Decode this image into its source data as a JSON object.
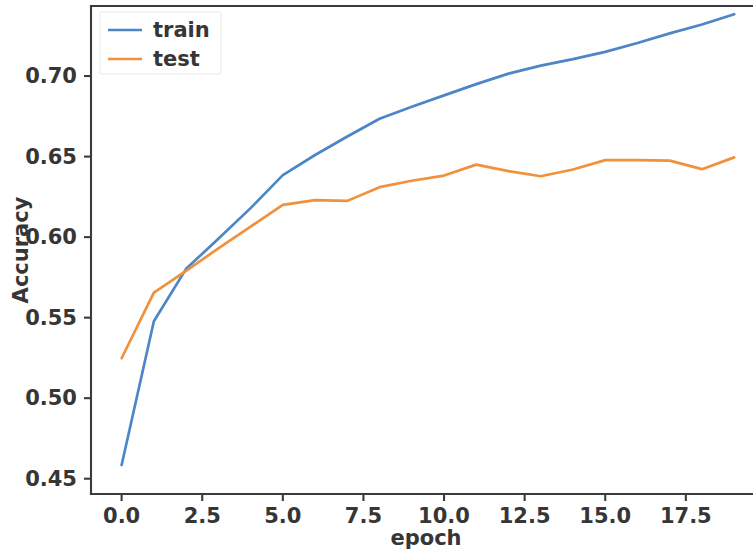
{
  "figure": {
    "background": "#ffffff",
    "plot_area": {
      "left": 91,
      "top": 6,
      "right": 760,
      "bottom": 494
    }
  },
  "chart_data": {
    "type": "line",
    "title": "",
    "xlabel": "epoch",
    "ylabel": "Accuracy",
    "xlim": [
      -0.95,
      19.8
    ],
    "ylim": [
      0.4405,
      0.7435
    ],
    "grid": false,
    "legend_position": "upper left",
    "xticks": [
      0.0,
      2.5,
      5.0,
      7.5,
      10.0,
      12.5,
      15.0,
      17.5
    ],
    "xtick_labels": [
      "0.0",
      "2.5",
      "5.0",
      "7.5",
      "10.0",
      "12.5",
      "15.0",
      "17.5"
    ],
    "yticks": [
      0.45,
      0.5,
      0.55,
      0.6,
      0.65,
      0.7
    ],
    "ytick_labels": [
      "0.45",
      "0.50",
      "0.55",
      "0.60",
      "0.65",
      "0.70"
    ],
    "x": [
      0,
      1,
      2,
      3,
      4,
      5,
      6,
      7,
      8,
      9,
      10,
      11,
      12,
      13,
      14,
      15,
      16,
      17,
      18,
      19
    ],
    "series": [
      {
        "name": "train",
        "color": "#4c86c6",
        "values": [
          0.4585,
          0.5478,
          0.5803,
          0.599,
          0.618,
          0.6385,
          0.651,
          0.6625,
          0.6735,
          0.681,
          0.688,
          0.695,
          0.7015,
          0.7065,
          0.7105,
          0.715,
          0.7205,
          0.7265,
          0.732,
          0.7384
        ]
      },
      {
        "name": "test",
        "color": "#f0913c",
        "values": [
          0.5248,
          0.5655,
          0.579,
          0.593,
          0.6065,
          0.62,
          0.623,
          0.6225,
          0.631,
          0.635,
          0.6382,
          0.645,
          0.641,
          0.6378,
          0.642,
          0.6478,
          0.6478,
          0.6475,
          0.6422,
          0.6495
        ]
      }
    ]
  },
  "legend": {
    "entries": [
      {
        "label": "train",
        "color": "#4c86c6"
      },
      {
        "label": "test",
        "color": "#f0913c"
      }
    ]
  }
}
